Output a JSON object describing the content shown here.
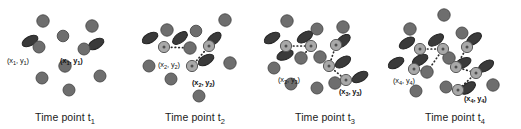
{
  "figure": {
    "type": "scientific-diagram",
    "background": "#ffffff",
    "colors": {
      "cell_plain": "#6e6e6e",
      "cell_plain_edge": "#4a4a4a",
      "cell_rod": "#3a3a3a",
      "cell_rod_edge": "#242424",
      "cell_hub": "#a8a8a8",
      "cell_hub_edge": "#5a5a5a",
      "hub_dot": "#4f4f4f",
      "link": "#2b2b2b",
      "text": "#141414"
    },
    "panel_width": 130,
    "panel_height": 129
  },
  "panels": [
    {
      "id": "t1",
      "caption_prefix": "Time point t",
      "caption_subscript": "1",
      "labels": [
        {
          "text": "(x",
          "sub1": "1",
          "mid": ", y",
          "sub2": "1",
          "close": ")",
          "bold": false,
          "x": 7,
          "y": 56
        },
        {
          "text": "(x",
          "sub1": "1",
          "mid": ", y",
          "sub2": "1",
          "close": ")",
          "bold": true,
          "x": 60,
          "y": 56
        }
      ],
      "plain_cells": [
        {
          "cx": 43,
          "cy": 21,
          "r": 6.2
        },
        {
          "cx": 63,
          "cy": 36,
          "r": 5.8
        },
        {
          "cx": 92,
          "cy": 26,
          "r": 6.2
        },
        {
          "cx": 39,
          "cy": 47,
          "r": 6.0
        },
        {
          "cx": 84,
          "cy": 49,
          "r": 6.0
        },
        {
          "cx": 65,
          "cy": 66,
          "r": 6.2
        },
        {
          "cx": 42,
          "cy": 78,
          "r": 6.0
        },
        {
          "cx": 100,
          "cy": 76,
          "r": 6.0
        },
        {
          "cx": 69,
          "cy": 90,
          "r": 6.0
        }
      ],
      "rod_cells": [
        {
          "cx": 30,
          "cy": 41,
          "rx": 8.6,
          "ry": 4.6,
          "rot": -28
        },
        {
          "cx": 96,
          "cy": 44,
          "rx": 8.6,
          "ry": 4.6,
          "rot": -30
        }
      ],
      "hub_cells": [],
      "links": []
    },
    {
      "id": "t2",
      "caption_prefix": "Time point t",
      "caption_subscript": "2",
      "labels": [
        {
          "text": "(x",
          "sub1": "2",
          "mid": ", y",
          "sub2": "2",
          "close": ")",
          "bold": false,
          "x": 28,
          "y": 60
        },
        {
          "text": "(x",
          "sub1": "2",
          "mid": ", y",
          "sub2": "2",
          "close": ")",
          "bold": true,
          "x": 62,
          "y": 78
        }
      ],
      "plain_cells": [
        {
          "cx": 37,
          "cy": 30,
          "r": 6.2
        },
        {
          "cx": 66,
          "cy": 31,
          "r": 5.8
        },
        {
          "cx": 95,
          "cy": 20,
          "r": 6.2
        },
        {
          "cx": 60,
          "cy": 48,
          "r": 6.2
        },
        {
          "cx": 19,
          "cy": 66,
          "r": 6.0
        },
        {
          "cx": 100,
          "cy": 63,
          "r": 6.2
        },
        {
          "cx": 41,
          "cy": 79,
          "r": 6.0
        },
        {
          "cx": 69,
          "cy": 96,
          "r": 6.0
        }
      ],
      "rod_cells": [
        {
          "cx": 20,
          "cy": 38,
          "rx": 8.6,
          "ry": 4.6,
          "rot": -30
        },
        {
          "cx": 50,
          "cy": 38,
          "rx": 8.6,
          "ry": 4.6,
          "rot": -38
        },
        {
          "cx": 84,
          "cy": 39,
          "rx": 8.6,
          "ry": 4.6,
          "rot": -42
        },
        {
          "cx": 76,
          "cy": 60,
          "rx": 8.6,
          "ry": 4.6,
          "rot": -30
        }
      ],
      "hub_cells": [
        {
          "cx": 34,
          "cy": 47,
          "r": 5.6
        },
        {
          "cx": 79,
          "cy": 46,
          "r": 5.6
        },
        {
          "cx": 62,
          "cy": 66,
          "r": 5.6
        }
      ],
      "links": [
        {
          "x1": 34,
          "y1": 47,
          "x2": 60,
          "y2": 48
        },
        {
          "x1": 79,
          "y1": 46,
          "x2": 62,
          "y2": 66
        }
      ]
    },
    {
      "id": "t3",
      "caption_prefix": "Time point t",
      "caption_subscript": "3",
      "labels": [
        {
          "text": "(x",
          "sub1": "3",
          "mid": ", y",
          "sub2": "3",
          "close": ")",
          "bold": false,
          "x": 18,
          "y": 75
        },
        {
          "text": "(x",
          "sub1": "3",
          "mid": ", y",
          "sub2": "3",
          "close": ")",
          "bold": true,
          "x": 79,
          "y": 87
        }
      ],
      "plain_cells": [
        {
          "cx": 27,
          "cy": 21,
          "r": 6.2
        },
        {
          "cx": 57,
          "cy": 29,
          "r": 6.0
        },
        {
          "cx": 83,
          "cy": 27,
          "r": 6.2
        },
        {
          "cx": 60,
          "cy": 57,
          "r": 6.2
        },
        {
          "cx": 14,
          "cy": 68,
          "r": 6.0
        },
        {
          "cx": 41,
          "cy": 58,
          "r": 6.2
        },
        {
          "cx": 31,
          "cy": 84,
          "r": 6.0
        },
        {
          "cx": 57,
          "cy": 88,
          "r": 6.0
        },
        {
          "cx": 75,
          "cy": 83,
          "r": 6.2
        }
      ],
      "rod_cells": [
        {
          "cx": 12,
          "cy": 38,
          "rx": 8.6,
          "ry": 4.6,
          "rot": -30
        },
        {
          "cx": 45,
          "cy": 37,
          "rx": 8.6,
          "ry": 4.6,
          "rot": -32
        },
        {
          "cx": 83,
          "cy": 41,
          "rx": 8.6,
          "ry": 4.6,
          "rot": -40
        },
        {
          "cx": 25,
          "cy": 55,
          "rx": 8.6,
          "ry": 4.6,
          "rot": -22
        },
        {
          "cx": 83,
          "cy": 62,
          "rx": 8.6,
          "ry": 4.6,
          "rot": -32
        },
        {
          "cx": 100,
          "cy": 77,
          "rx": 8.6,
          "ry": 4.6,
          "rot": -28
        }
      ],
      "hub_cells": [
        {
          "cx": 26,
          "cy": 46,
          "r": 5.6
        },
        {
          "cx": 51,
          "cy": 46,
          "r": 5.6
        },
        {
          "cx": 76,
          "cy": 45,
          "r": 5.6
        },
        {
          "cx": 69,
          "cy": 66,
          "r": 5.6
        },
        {
          "cx": 86,
          "cy": 80,
          "r": 5.6
        }
      ],
      "links": [
        {
          "x1": 26,
          "y1": 46,
          "x2": 51,
          "y2": 46
        },
        {
          "x1": 51,
          "y1": 46,
          "x2": 41,
          "y2": 58
        },
        {
          "x1": 76,
          "y1": 45,
          "x2": 69,
          "y2": 66
        },
        {
          "x1": 69,
          "y1": 66,
          "x2": 86,
          "y2": 80
        }
      ]
    },
    {
      "id": "t4",
      "caption_prefix": "Time point t",
      "caption_subscript": "4",
      "labels": [
        {
          "text": "(x",
          "sub1": "4",
          "mid": ", y",
          "sub2": "4",
          "close": ")",
          "bold": false,
          "x": 3,
          "y": 76
        },
        {
          "text": "(x",
          "sub1": "4",
          "mid": ", y",
          "sub2": "4",
          "close": ")",
          "bold": true,
          "x": 74,
          "y": 94
        }
      ],
      "plain_cells": [
        {
          "cx": 54,
          "cy": 15,
          "r": 6.2
        },
        {
          "cx": 20,
          "cy": 29,
          "r": 6.2
        },
        {
          "cx": 72,
          "cy": 33,
          "r": 6.0
        },
        {
          "cx": 59,
          "cy": 58,
          "r": 6.2
        },
        {
          "cx": 37,
          "cy": 72,
          "r": 6.2
        },
        {
          "cx": 26,
          "cy": 91,
          "r": 6.0
        },
        {
          "cx": 56,
          "cy": 87,
          "r": 6.0
        },
        {
          "cx": 103,
          "cy": 85,
          "r": 6.2
        }
      ],
      "rod_cells": [
        {
          "cx": 17,
          "cy": 43,
          "rx": 8.6,
          "ry": 4.6,
          "rot": -32
        },
        {
          "cx": 46,
          "cy": 40,
          "rx": 8.6,
          "ry": 4.6,
          "rot": -34
        },
        {
          "cx": 84,
          "cy": 39,
          "rx": 8.6,
          "ry": 4.6,
          "rot": -36
        },
        {
          "cx": 30,
          "cy": 60,
          "rx": 8.6,
          "ry": 4.6,
          "rot": -30
        },
        {
          "cx": 6,
          "cy": 63,
          "rx": 8.6,
          "ry": 4.6,
          "rot": -30
        },
        {
          "cx": 73,
          "cy": 63,
          "rx": 8.6,
          "ry": 4.6,
          "rot": -26
        },
        {
          "cx": 96,
          "cy": 66,
          "rx": 8.6,
          "ry": 4.6,
          "rot": -32
        },
        {
          "cx": 78,
          "cy": 88,
          "rx": 8.6,
          "ry": 4.6,
          "rot": -36
        }
      ],
      "hub_cells": [
        {
          "cx": 30,
          "cy": 49,
          "r": 5.6
        },
        {
          "cx": 53,
          "cy": 49,
          "r": 5.6
        },
        {
          "cx": 77,
          "cy": 47,
          "r": 5.6
        },
        {
          "cx": 24,
          "cy": 69,
          "r": 5.6
        },
        {
          "cx": 66,
          "cy": 67,
          "r": 5.6
        },
        {
          "cx": 86,
          "cy": 73,
          "r": 5.6
        },
        {
          "cx": 68,
          "cy": 90,
          "r": 5.6
        }
      ],
      "links": [
        {
          "x1": 30,
          "y1": 49,
          "x2": 53,
          "y2": 49
        },
        {
          "x1": 53,
          "y1": 49,
          "x2": 37,
          "y2": 72
        },
        {
          "x1": 24,
          "y1": 69,
          "x2": 37,
          "y2": 72
        },
        {
          "x1": 77,
          "y1": 47,
          "x2": 66,
          "y2": 67
        },
        {
          "x1": 66,
          "y1": 67,
          "x2": 86,
          "y2": 73
        },
        {
          "x1": 86,
          "y1": 73,
          "x2": 68,
          "y2": 90
        }
      ]
    }
  ]
}
